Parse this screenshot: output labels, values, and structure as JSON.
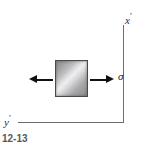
{
  "figure": {
    "caption": "12-13",
    "background_color": "#ffffff"
  },
  "axes": {
    "vertical": {
      "label_base": "x",
      "label_prime": "′",
      "icon": "axis-line-vertical",
      "color": "#6e6e72"
    },
    "horizontal": {
      "label_base": "y",
      "label_prime": "′",
      "icon": "axis-line-horizontal",
      "color": "#6e6e72"
    }
  },
  "element": {
    "name": "stress-element-square",
    "fill_light": "#e8e8ea",
    "fill_dark": "#8a8a8c",
    "border_color": "#4a4a4d"
  },
  "loads": {
    "left_arrow": {
      "icon": "arrow-left-icon",
      "direction": "left",
      "color": "#111113"
    },
    "right_arrow": {
      "icon": "arrow-right-icon",
      "direction": "right",
      "color": "#111113"
    },
    "stress_symbol": "σ"
  },
  "chart_data": {
    "type": "diagram",
    "annotations": [
      "x′",
      "y′",
      "σ"
    ],
    "elements": [
      {
        "name": "square-element",
        "x": 55,
        "y": 60,
        "width": 33,
        "height": 37
      },
      {
        "name": "tension-arrow-left",
        "x": 29,
        "y": 75,
        "direction": "left"
      },
      {
        "name": "tension-arrow-right",
        "x": 90,
        "y": 75,
        "direction": "right"
      },
      {
        "name": "axis-x-prime",
        "orientation": "vertical",
        "x": 123
      },
      {
        "name": "axis-y-prime",
        "orientation": "horizontal",
        "y": 122
      }
    ]
  }
}
